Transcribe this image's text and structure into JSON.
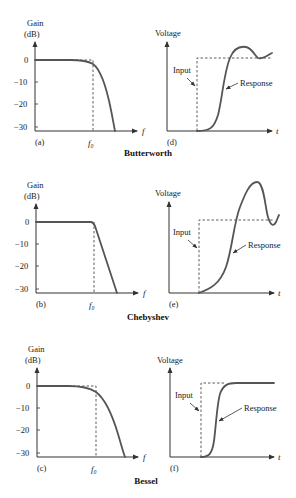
{
  "figure": {
    "rows": [
      {
        "filter": "Butterworth",
        "gain_panel": {
          "label": "(a)",
          "y_axis_title_line1": "Gain",
          "y_axis_title_line2": "(dB)",
          "y_ticks": [
            "0",
            "−10",
            "−20",
            "−30"
          ],
          "x_axis_label": "f",
          "cutoff_label": "f₀"
        },
        "step_panel": {
          "label": "(d)",
          "y_axis_title": "Voltage",
          "x_axis_label": "t",
          "input_label": "Input",
          "response_label": "Response"
        }
      },
      {
        "filter": "Chebyshev",
        "gain_panel": {
          "label": "(b)",
          "y_axis_title_line1": "Gain",
          "y_axis_title_line2": "(dB)",
          "y_ticks": [
            "0",
            "−10",
            "−20",
            "−30"
          ],
          "x_axis_label": "f",
          "cutoff_label": "f₀"
        },
        "step_panel": {
          "label": "(e)",
          "y_axis_title": "Voltage",
          "x_axis_label": "t",
          "input_label": "Input",
          "response_label": "Response"
        }
      },
      {
        "filter": "Bessel",
        "gain_panel": {
          "label": "(c)",
          "y_axis_title_line1": "Gain",
          "y_axis_title_line2": "(dB)",
          "y_ticks": [
            "0",
            "−10",
            "−20",
            "−30"
          ],
          "x_axis_label": "f",
          "cutoff_label": "f₀"
        },
        "step_panel": {
          "label": "(f)",
          "y_axis_title": "Voltage",
          "x_axis_label": "t",
          "input_label": "Input",
          "response_label": "Response"
        }
      }
    ],
    "colors": {
      "axis": "#333333",
      "curve": "#555555",
      "text": "#222222"
    }
  }
}
